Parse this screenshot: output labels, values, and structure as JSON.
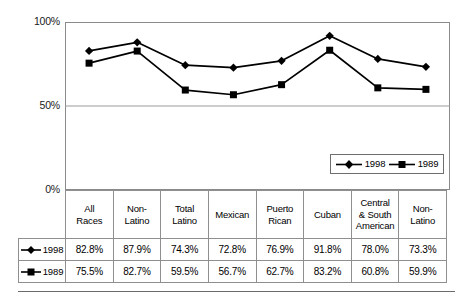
{
  "chart_data": {
    "type": "line",
    "title": "",
    "subtitle": "",
    "xlabel": "",
    "ylabel": "",
    "ylim": [
      0,
      100
    ],
    "yticks": [
      "0%",
      "50%",
      "100%"
    ],
    "ytick_values": [
      0,
      50,
      100
    ],
    "grid": "horizontal gridline at 50% only",
    "legend_position": "inside bottom-right of plot area",
    "categories": [
      "All Races",
      "Non-Latino",
      "Total Latino",
      "Mexican",
      "Puerto Rican",
      "Cuban",
      "Central & South American",
      "Non-Latino"
    ],
    "series": [
      {
        "name": "1998",
        "marker": "diamond",
        "color": "#000000",
        "values": [
          82.8,
          87.9,
          74.3,
          72.8,
          76.9,
          91.8,
          78.0,
          73.3
        ],
        "labels": [
          "82.8%",
          "87.9%",
          "74.3%",
          "72.8%",
          "76.9%",
          "91.8%",
          "78.0%",
          "73.3%"
        ]
      },
      {
        "name": "1989",
        "marker": "square",
        "color": "#000000",
        "values": [
          75.5,
          82.7,
          59.5,
          56.7,
          62.7,
          83.2,
          60.8,
          59.9
        ],
        "labels": [
          "75.5%",
          "82.7%",
          "59.5%",
          "56.7%",
          "62.7%",
          "83.2%",
          "60.8%",
          "59.9%"
        ]
      }
    ]
  },
  "axis": {
    "y_top": "100%",
    "y_mid": "50%",
    "y_bottom": "0%"
  },
  "legend": {
    "items": [
      {
        "label": "1998",
        "marker": "diamond-marker-icon"
      },
      {
        "label": "1989",
        "marker": "square-marker-icon"
      }
    ]
  },
  "table": {
    "headers": [
      "All\nRaces",
      "Non-\nLatino",
      "Total\nLatino",
      "Mexican",
      "Puerto\nRican",
      "Cuban",
      "Central\n& South\nAmerican",
      "Non-\nLatino"
    ],
    "header_lines": [
      [
        "All",
        "Races"
      ],
      [
        "Non-",
        "Latino"
      ],
      [
        "Total",
        "Latino"
      ],
      [
        "Mexican"
      ],
      [
        "Puerto",
        "Rican"
      ],
      [
        "Cuban"
      ],
      [
        "Central",
        "& South",
        "American"
      ],
      [
        "Non-",
        "Latino"
      ]
    ],
    "rows": [
      {
        "label": "1998",
        "marker": "diamond-marker-icon",
        "values": [
          "82.8%",
          "87.9%",
          "74.3%",
          "72.8%",
          "76.9%",
          "91.8%",
          "78.0%",
          "73.3%"
        ]
      },
      {
        "label": "1989",
        "marker": "square-marker-icon",
        "values": [
          "75.5%",
          "82.7%",
          "59.5%",
          "56.7%",
          "62.7%",
          "83.2%",
          "60.8%",
          "59.9%"
        ]
      }
    ]
  },
  "colors": {
    "series_line": "#000000",
    "frame": "#8a8a8a",
    "gridline": "#9a9a9a",
    "table_border": "#8f8f8f",
    "rule": "#6b6b6b"
  }
}
